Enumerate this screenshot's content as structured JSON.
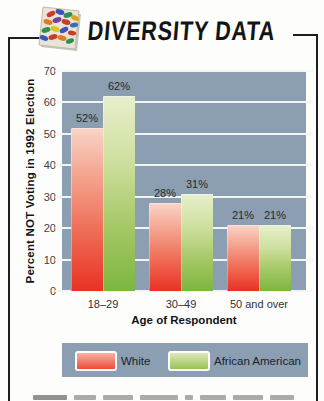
{
  "header": {
    "title": "DIVERSITY DATA",
    "icon": "mosaic-tiles-icon"
  },
  "chart_data": {
    "type": "bar",
    "title": "",
    "categories": [
      "18–29",
      "30–49",
      "50 and over"
    ],
    "series": [
      {
        "name": "White",
        "values": [
          52,
          28,
          21
        ],
        "labels": [
          "52%",
          "28%",
          "21%"
        ],
        "color": "#e93125"
      },
      {
        "name": "African American",
        "values": [
          62,
          31,
          21
        ],
        "labels": [
          "62%",
          "31%",
          "21%"
        ],
        "color": "#7cb63f"
      }
    ],
    "xlabel": "Age of Respondent",
    "ylabel": "Percent NOT Voting in 1992 Election",
    "ylim": [
      0,
      70
    ],
    "yticks": [
      0,
      10,
      20,
      30,
      40,
      50,
      60,
      70
    ],
    "grid": true,
    "legend_position": "bottom",
    "plot_bg": "#8c9fb2"
  },
  "legend": {
    "items": [
      {
        "label": "White",
        "swatch_color": "#e93125"
      },
      {
        "label": "African American",
        "swatch_color": "#7cb63f"
      }
    ]
  }
}
